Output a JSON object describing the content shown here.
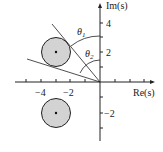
{
  "diagram": {
    "type": "complex-plane",
    "axes": {
      "x_label": "Re(s)",
      "y_label": "Im(s)",
      "x_ticks": [
        -5,
        -4,
        -3,
        -2,
        -1,
        1,
        2,
        3,
        4
      ],
      "x_tick_labels": [
        {
          "value": -4,
          "text": "−4"
        },
        {
          "value": -2,
          "text": "−2"
        }
      ],
      "y_ticks": [
        -3,
        -2,
        -1,
        1,
        2,
        3,
        4
      ],
      "y_tick_labels": [
        {
          "value": 4,
          "text": "4"
        },
        {
          "value": 2,
          "text": "2"
        },
        {
          "value": -2,
          "text": "−2"
        }
      ]
    },
    "regions": [
      {
        "name": "upper-disk",
        "center": [
          -3,
          2
        ],
        "radius": 1,
        "fill": "#d3d3d3"
      },
      {
        "name": "lower-disk",
        "center": [
          -3,
          -2
        ],
        "radius": 1,
        "fill": "#d3d3d3"
      }
    ],
    "tangent_lines": [
      {
        "name": "line-theta1"
      },
      {
        "name": "line-theta2"
      }
    ],
    "angles": {
      "theta1": "θ",
      "theta1_sub": "1",
      "theta2": "θ",
      "theta2_sub": "2"
    },
    "colors": {
      "stroke": "#222222",
      "disk_fill": "#d3d3d3"
    }
  }
}
